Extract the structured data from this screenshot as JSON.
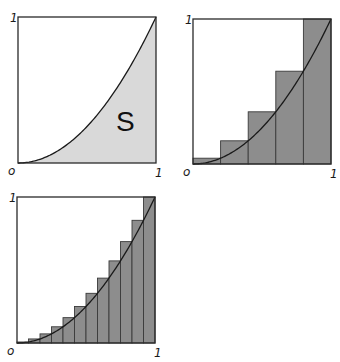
{
  "chart_data": [
    {
      "type": "area",
      "title": "",
      "function": "y = x^2",
      "xlim": [
        0,
        1
      ],
      "ylim": [
        0,
        1
      ],
      "region_label": "S",
      "tick_labels": {
        "origin": "o",
        "x_end": "1",
        "y_end": "1"
      },
      "area_fill": "#d9d9d9",
      "curve_color": "#1a1a1a"
    },
    {
      "type": "bar",
      "title": "",
      "function": "y = x^2",
      "xlim": [
        0,
        1
      ],
      "ylim": [
        0,
        1
      ],
      "n_rectangles": 5,
      "rectangle_rule": "right-endpoint (upper sum)",
      "x_intervals": [
        [
          0,
          0.2
        ],
        [
          0.2,
          0.4
        ],
        [
          0.4,
          0.6
        ],
        [
          0.6,
          0.8
        ],
        [
          0.8,
          1.0
        ]
      ],
      "values": [
        0.04,
        0.16,
        0.36,
        0.64,
        1.0
      ],
      "tick_labels": {
        "origin": "o",
        "x_end": "1",
        "y_end": "1"
      },
      "bar_fill": "#8d8d8d"
    },
    {
      "type": "bar",
      "title": "",
      "function": "y = x^2",
      "xlim": [
        0,
        1
      ],
      "ylim": [
        0,
        1
      ],
      "n_rectangles": 12,
      "rectangle_rule": "right-endpoint (upper sum)",
      "values": [
        0.0069,
        0.0278,
        0.0625,
        0.1111,
        0.1736,
        0.25,
        0.3403,
        0.4444,
        0.5625,
        0.6944,
        0.8403,
        1.0
      ],
      "tick_labels": {
        "origin": "o",
        "x_end": "1",
        "y_end": "1"
      },
      "bar_fill": "#8d8d8d"
    }
  ]
}
